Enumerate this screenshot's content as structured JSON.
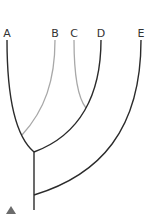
{
  "diagram": {
    "type": "cladogram",
    "taxa": [
      {
        "label": "A",
        "x": 7
      },
      {
        "label": "B",
        "x": 55
      },
      {
        "label": "C",
        "x": 74
      },
      {
        "label": "D",
        "x": 101
      },
      {
        "label": "E",
        "x": 141
      }
    ],
    "colors": {
      "main_branch": "#2b2b2b",
      "secondary_branch": "#a8a8a8",
      "marker": "#6b6b6b"
    },
    "marker": {
      "shape": "triangle",
      "color": "#6b6b6b"
    }
  }
}
